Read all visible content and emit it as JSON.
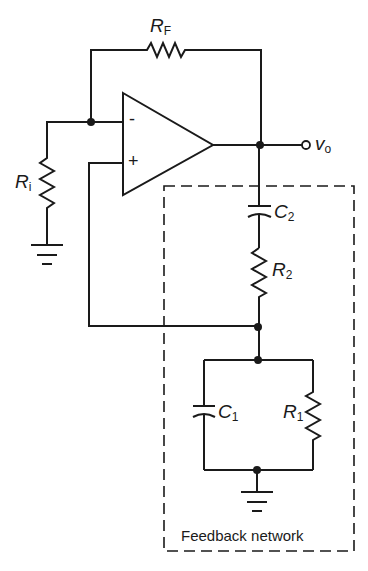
{
  "diagram": {
    "type": "circuit-schematic",
    "components": {
      "rf": {
        "symbol": "R",
        "subscript": "F"
      },
      "ri": {
        "symbol": "R",
        "subscript": "i"
      },
      "c2": {
        "symbol": "C",
        "subscript": "2"
      },
      "r2": {
        "symbol": "R",
        "subscript": "2"
      },
      "c1": {
        "symbol": "C",
        "subscript": "1"
      },
      "r1": {
        "symbol": "R",
        "subscript": "1"
      }
    },
    "opamp": {
      "inverting_label": "-",
      "noninverting_label": "+"
    },
    "output": {
      "symbol": "v",
      "subscript": "o"
    },
    "feedback_box_label": "Feedback network",
    "colors": {
      "line": "#1a1a1a",
      "background": "#ffffff"
    }
  }
}
